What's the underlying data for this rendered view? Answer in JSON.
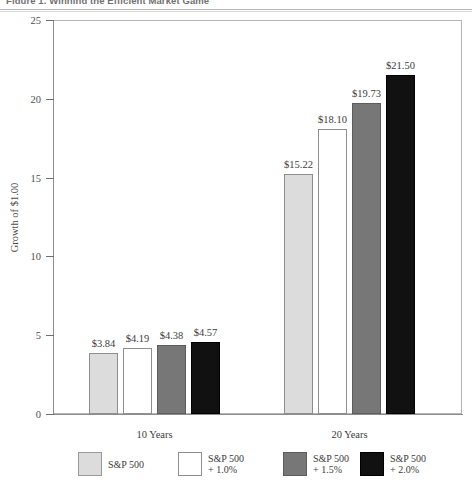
{
  "figure": {
    "title": "Figure 1.  Winning the Efficient Market Game"
  },
  "chart_data": {
    "type": "bar",
    "title": "Figure 1.  Winning the Efficient Market Game",
    "xlabel": "",
    "ylabel": "Growth of $1.00",
    "ylim": [
      0,
      25
    ],
    "yticks": [
      0,
      5,
      10,
      15,
      20,
      25
    ],
    "ytick_labels": [
      "0",
      "5",
      "10",
      "15",
      "20",
      "25"
    ],
    "grid": false,
    "legend_position": "bottom",
    "categories": [
      "10 Years",
      "20 Years"
    ],
    "series": [
      {
        "name": "S&P 500",
        "legend_line1": "S&P 500",
        "legend_line2": "",
        "color": "#dcdcdc",
        "values": [
          3.84,
          4.19
        ],
        "labels": [
          "$3.84",
          "$15.22"
        ]
      },
      {
        "name": "S&P 500 + 1.0%",
        "legend_line1": "S&P 500",
        "legend_line2": "+ 1.0%",
        "color": "#ffffff",
        "values": [
          4.19,
          18.1
        ],
        "labels": [
          "$4.19",
          "$18.10"
        ]
      },
      {
        "name": "S&P 500 + 1.5%",
        "legend_line1": "S&P 500",
        "legend_line2": "+ 1.5%",
        "color": "#777777",
        "values": [
          4.38,
          19.73
        ],
        "labels": [
          "$4.38",
          "$19.73"
        ]
      },
      {
        "name": "S&P 500 + 2.0%",
        "legend_line1": "S&P 500",
        "legend_line2": "+ 2.0%",
        "color": "#111111",
        "values": [
          4.57,
          21.5
        ],
        "labels": [
          "$4.57",
          "$21.50"
        ]
      }
    ],
    "groups": [
      {
        "category": "10 Years",
        "bars": [
          {
            "series": "S&P 500",
            "value": 3.84,
            "label": "$3.84"
          },
          {
            "series": "S&P 500 + 1.0%",
            "value": 4.19,
            "label": "$4.19"
          },
          {
            "series": "S&P 500 + 1.5%",
            "value": 4.38,
            "label": "$4.38"
          },
          {
            "series": "S&P 500 + 2.0%",
            "value": 4.57,
            "label": "$4.57"
          }
        ]
      },
      {
        "category": "20 Years",
        "bars": [
          {
            "series": "S&P 500",
            "value": 15.22,
            "label": "$15.22"
          },
          {
            "series": "S&P 500 + 1.0%",
            "value": 18.1,
            "label": "$18.10"
          },
          {
            "series": "S&P 500 + 1.5%",
            "value": 19.73,
            "label": "$19.73"
          },
          {
            "series": "S&P 500 + 2.0%",
            "value": 21.5,
            "label": "$21.50"
          }
        ]
      }
    ]
  }
}
